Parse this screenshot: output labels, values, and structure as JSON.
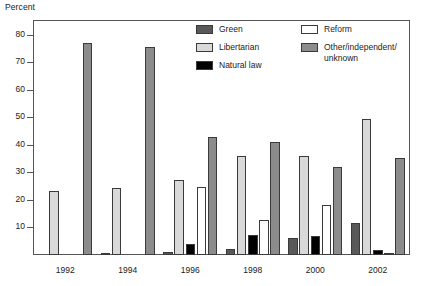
{
  "chart_data": {
    "type": "bar",
    "title": "",
    "subtitle": "",
    "ylabel": "Percent",
    "xlabel": "",
    "categories": [
      "1992",
      "1994",
      "1996",
      "1998",
      "2000",
      "2002"
    ],
    "ylim": [
      0,
      85
    ],
    "yticks": [
      10,
      20,
      30,
      40,
      50,
      60,
      70,
      80
    ],
    "ytick_labels": [
      "10",
      "20",
      "30",
      "40",
      "50",
      "60",
      "70",
      "80"
    ],
    "grid": false,
    "legend_position": "inside-top-right",
    "series": [
      {
        "name": "Green",
        "color": "#595959",
        "values": [
          0,
          0.3,
          1.0,
          2.2,
          6.2,
          11.5
        ]
      },
      {
        "name": "Libertarian",
        "color": "#d9d9d9",
        "values": [
          23.2,
          24.3,
          27.1,
          35.8,
          36.0,
          49.3
        ]
      },
      {
        "name": "Natural law",
        "color": "#000000",
        "values": [
          0,
          0,
          4.0,
          7.3,
          7.0,
          2.0
        ]
      },
      {
        "name": "Reform",
        "color": "#ffffff",
        "values": [
          0,
          0,
          24.7,
          12.7,
          18.0,
          0.6
        ]
      },
      {
        "name": "Other/independent/\nunknown",
        "color": "#8c8c8c",
        "values": [
          77.0,
          75.5,
          42.9,
          41.2,
          32.1,
          35.2
        ]
      }
    ]
  },
  "legend": {
    "column_left": [
      {
        "label": "Green",
        "color": "#595959"
      },
      {
        "label": "Libertarian",
        "color": "#d9d9d9"
      },
      {
        "label": "Natural law",
        "color": "#000000"
      }
    ],
    "column_right": [
      {
        "label": "Reform",
        "color": "#ffffff"
      },
      {
        "label": "Other/independent/\nunknown",
        "color": "#8c8c8c"
      }
    ]
  },
  "colors": {
    "axis": "#555555",
    "bar_outline": "#3a3a3a",
    "background": "#ffffff",
    "text": "#1a1a1a"
  }
}
